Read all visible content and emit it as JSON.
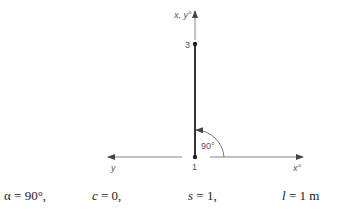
{
  "diagram": {
    "vertical_axis_label": "x, y°",
    "horizontal_left_axis_label": "y",
    "horizontal_right_axis_label": "x°",
    "node_start": "1",
    "node_end": "3",
    "angle_label": "90°"
  },
  "formula": {
    "alpha": {
      "symbol": "α",
      "rest": " = 90°,"
    },
    "c": {
      "symbol": "c",
      "rest": " = 0,"
    },
    "s": {
      "symbol": "s",
      "rest": " = 1,"
    },
    "l": {
      "symbol": "l",
      "rest": " = 1 m"
    }
  },
  "colors": {
    "line": "#333333",
    "axis": "#555555",
    "node": "#222222"
  }
}
